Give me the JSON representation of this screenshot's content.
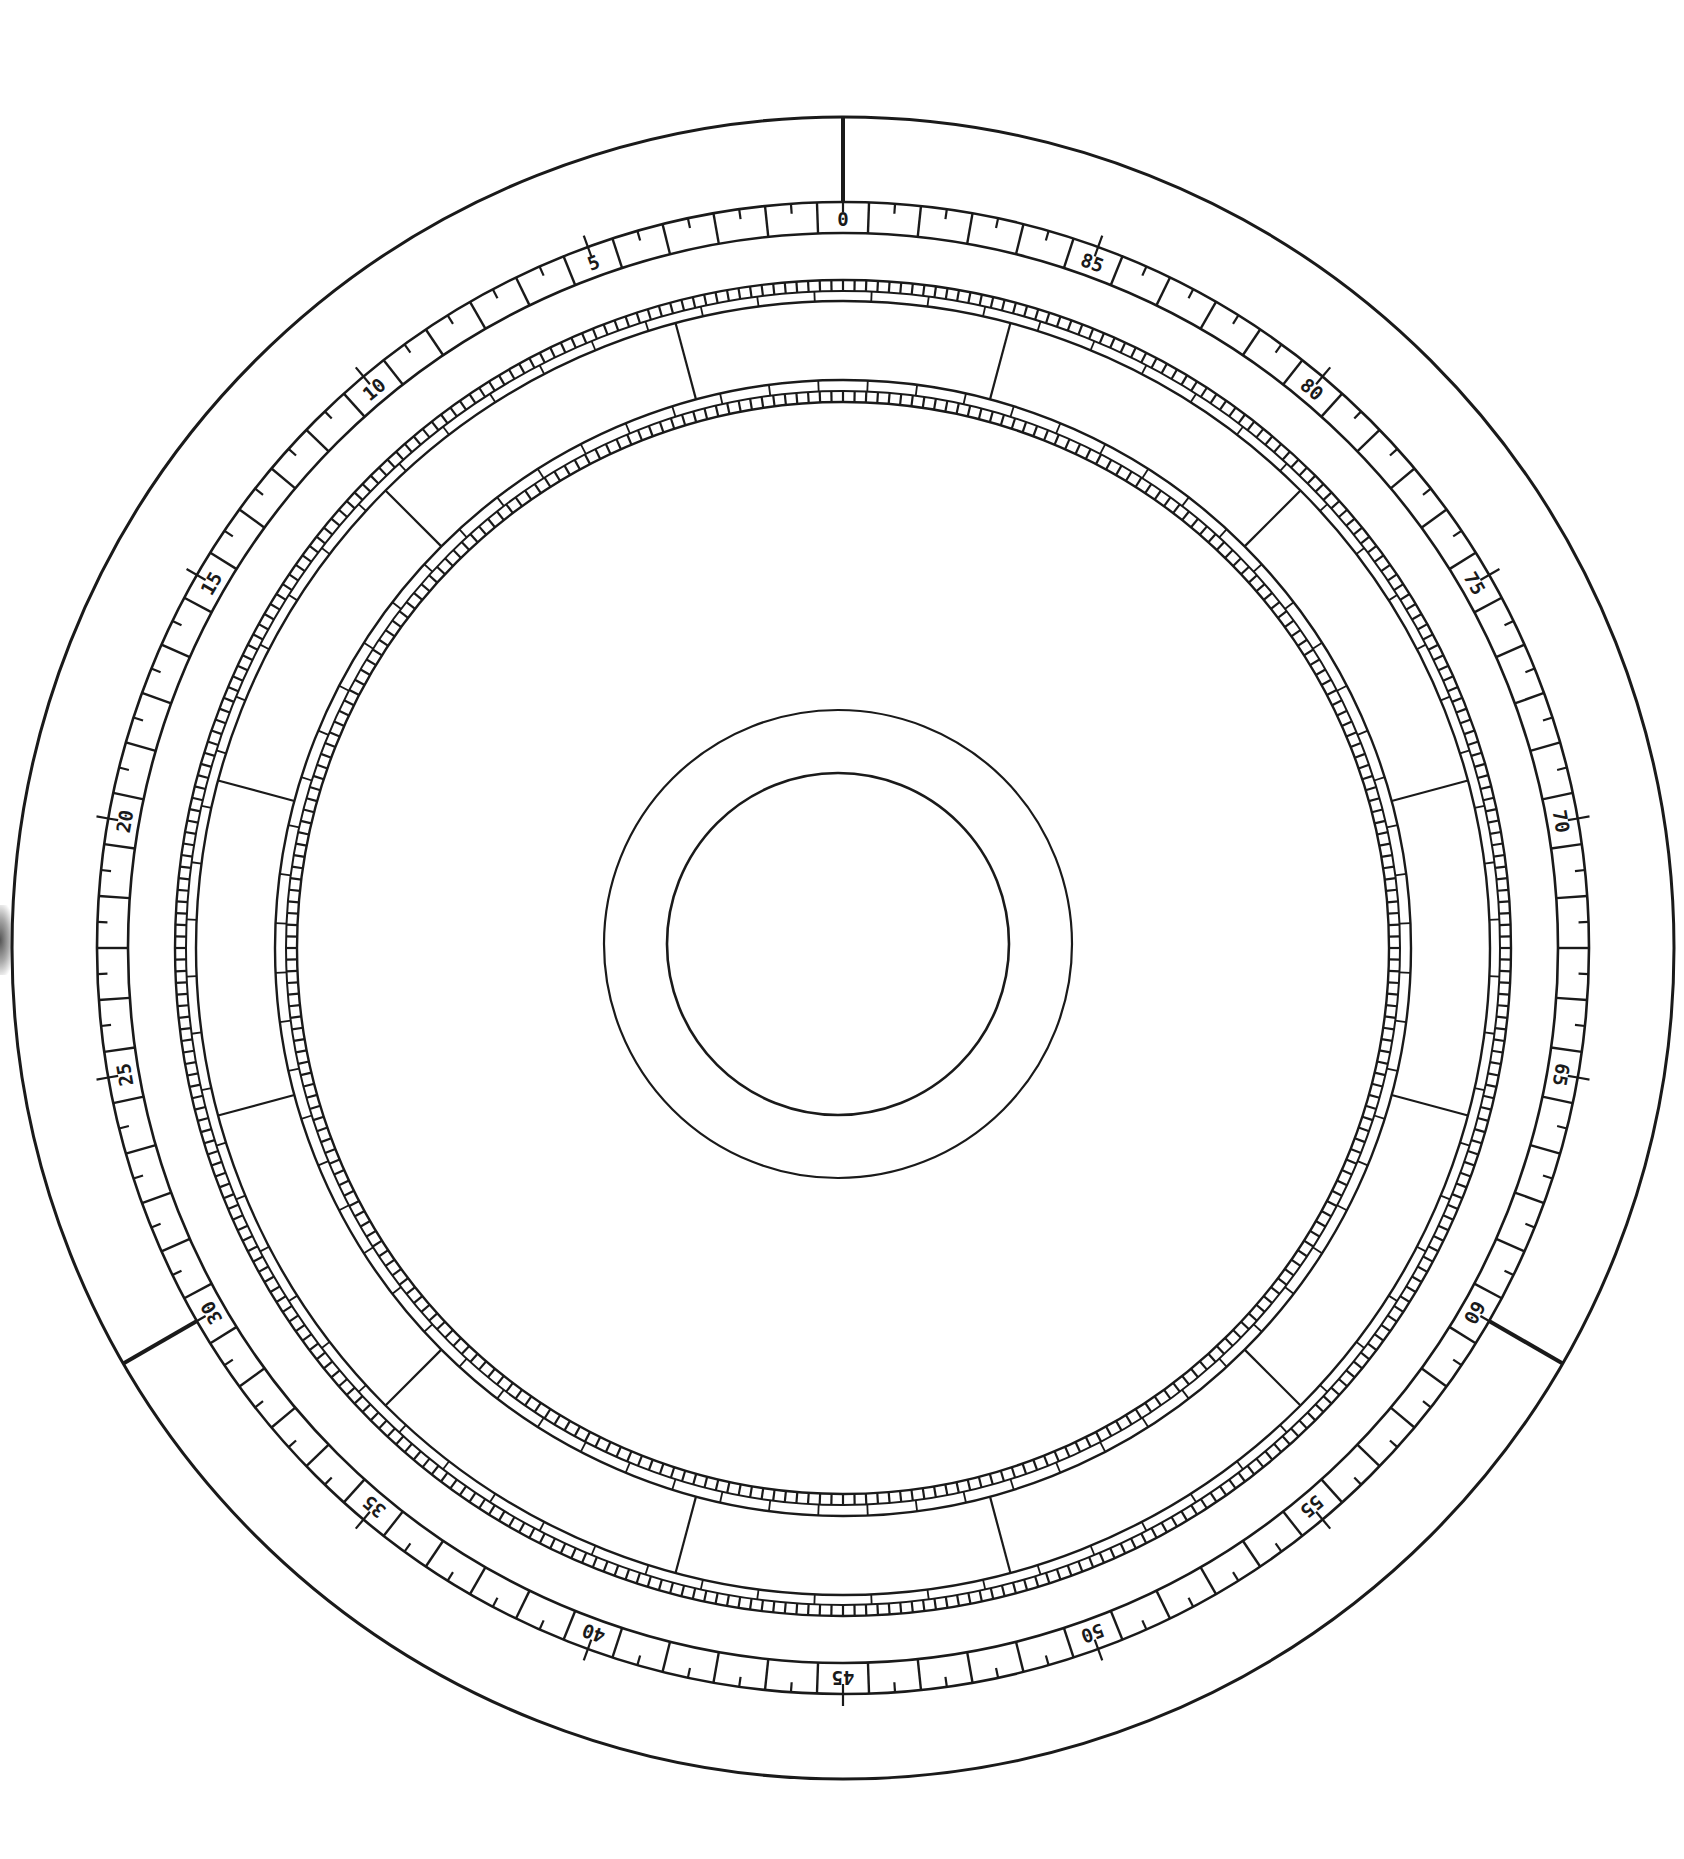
{
  "diagram": {
    "type": "circular-dial-template",
    "center": {
      "x": 843,
      "y": 948
    },
    "stroke_color": "#1a1a1a",
    "background": "#ffffff",
    "outer_circle": {
      "r": 831,
      "stroke_width": 3
    },
    "zero_markers": {
      "positions": [
        0,
        30,
        60
      ],
      "from_r": 831,
      "to_r": 746,
      "stroke_width": 4
    },
    "scale_ring": {
      "outer_r": 746,
      "inner_r": 715,
      "units": 90,
      "direction": "counterclockwise",
      "cell_divider_offset": 0.5,
      "half_tick_length": 10,
      "major_every": 5,
      "major_tick_outward": 12,
      "labels": [
        "0",
        "5",
        "10",
        "15",
        "20",
        "25",
        "30",
        "35",
        "40",
        "45",
        "50",
        "55",
        "60",
        "65",
        "70",
        "75",
        "80",
        "85"
      ]
    },
    "band_outer": {
      "r_outer": 668,
      "r_mid": 657,
      "r_inner": 647,
      "small_squares_side": "outer",
      "small_square_count": 360,
      "large_cell_count": 72
    },
    "band_inner": {
      "r_outer": 568,
      "r_mid": 557,
      "r_inner": 546,
      "small_squares_side": "inner",
      "small_square_count": 300,
      "large_cell_count": 72
    },
    "connectors": {
      "count": 12,
      "offset_deg": 15,
      "from_r": 647,
      "to_r": 568
    },
    "hub": {
      "outer_r": 234,
      "inner_r": 171,
      "center": {
        "x": 838,
        "y": 944
      }
    }
  }
}
